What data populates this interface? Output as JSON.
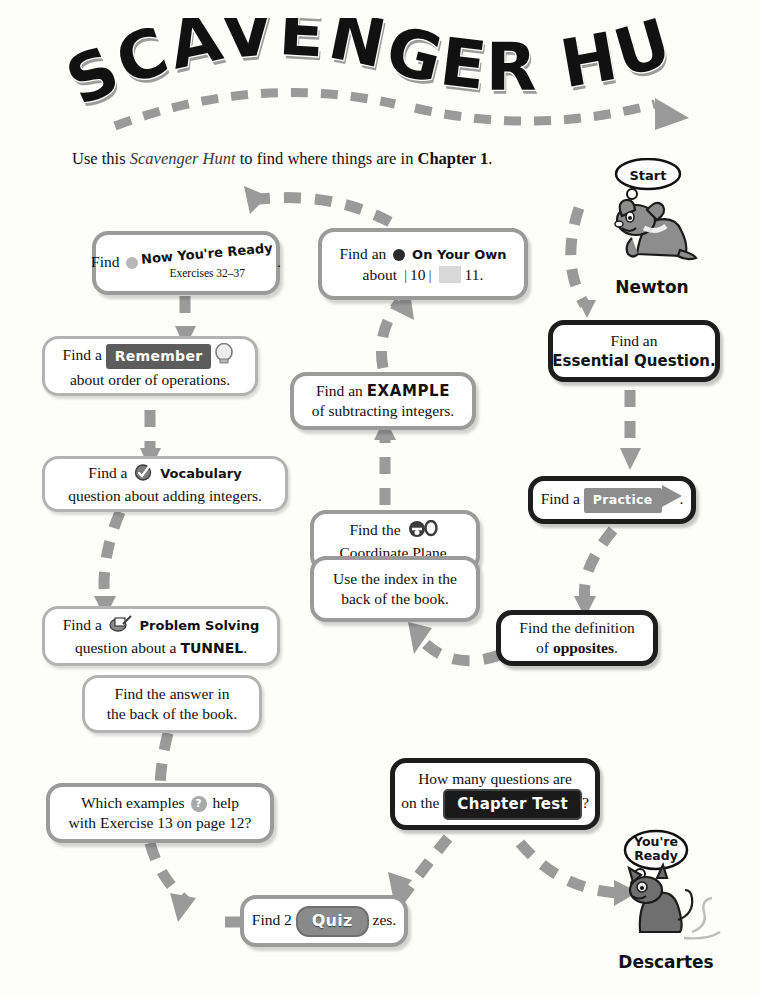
{
  "title": {
    "text": "SCAVENGER HUNT",
    "word1": "SCAVENGER",
    "word2": "HUNT"
  },
  "intro": {
    "part1": "Use this ",
    "emphasis": "Scavenger Hunt",
    "part2": " to find where things are in ",
    "bold": "Chapter 1",
    "part3": "."
  },
  "characters": {
    "start": {
      "name": "Newton",
      "bubble": "Start",
      "icon": "dog-character"
    },
    "end": {
      "name": "Descartes",
      "bubble_line1": "You're",
      "bubble_line2": "Ready",
      "icon": "cat-character"
    }
  },
  "boxes": {
    "now_youre_ready": {
      "lead": "Find",
      "tag": "Now You're Ready",
      "sub": "Exercises 32–37",
      "trail": ".",
      "icon": "bullet-dot-icon"
    },
    "on_your_own": {
      "line1_lead": "Find an",
      "tag": "On Your Own",
      "line2_lead": "about",
      "number1": "10",
      "number2": "11.",
      "icon": "bullet-dot-icon"
    },
    "remember": {
      "lead": "Find a",
      "tag": "Remember",
      "line2": "about order of operations.",
      "icon": "lightbulb-icon"
    },
    "example": {
      "line1_lead": "Find an",
      "line1_bold": "EXAMPLE",
      "line2": "of subtracting integers."
    },
    "vocabulary": {
      "lead": "Find a",
      "tag": "Vocabulary",
      "line2": "question about adding integers.",
      "icon": "check-circle-icon"
    },
    "coordinate_plane": {
      "line1": "Find the",
      "line2": "Coordinate Plane.",
      "icon": "key-icon"
    },
    "index": {
      "line1": "Use the index in the",
      "line2": "back of the book."
    },
    "problem_solving": {
      "lead": "Find a",
      "tag": "Problem Solving",
      "line2_lead": "question about a",
      "line2_bold": "TUNNEL",
      "line2_trail": ".",
      "icon": "clipboard-pencil-icon"
    },
    "answer_back": {
      "line1": "Find the answer in",
      "line2": "the back of the book."
    },
    "which_examples": {
      "line1_lead": "Which examples",
      "line1_trail": "help",
      "line2": "with Exercise 13 on page 12?",
      "icon": "question-mark-icon"
    },
    "quiz": {
      "lead": "Find 2",
      "tag": "Quiz",
      "trail": "zes."
    },
    "chapter_test": {
      "line1": "How many questions are",
      "line2_lead": "on the",
      "tag": "Chapter Test",
      "line2_trail": "?"
    },
    "essential_question": {
      "line1": "Find an",
      "line2": "Essential Question."
    },
    "practice": {
      "lead": "Find a",
      "tag": "Practice",
      "trail": "."
    },
    "opposites": {
      "line1": "Find the definition",
      "line2_lead": "of ",
      "line2_bold": "opposites",
      "line2_trail": "."
    }
  },
  "colors": {
    "box_border_gray": "#9b9b9b",
    "box_border_dark": "#1d1d1d",
    "arrow_gray": "#9a9a9a",
    "badge_dark": "#1a1a1a",
    "page_bg": "#fdfdfb"
  }
}
